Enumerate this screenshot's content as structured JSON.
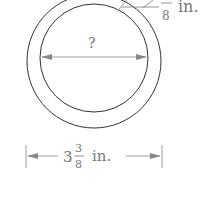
{
  "diagram": {
    "thickness_label": {
      "whole": "",
      "numerator": "?",
      "denominator": "8",
      "unit": "in."
    },
    "inner_diameter_label": "?",
    "outer_diameter_label": {
      "whole": "3",
      "numerator": "3",
      "denominator": "8",
      "unit": "in."
    },
    "colors": {
      "stroke": "#333333",
      "label": "#777777",
      "arrow": "#888888"
    }
  }
}
